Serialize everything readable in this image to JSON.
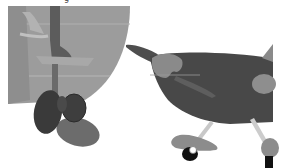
{
  "image": {
    "description": "Grayscale illustration: boat hull with rudder and propeller on the left, small airplane with landing gear on the right",
    "width": 283,
    "height": 168,
    "caption_fragment": "g",
    "colors": {
      "background": "#ffffff",
      "hull": "#9a9a9a",
      "hull_light": "#b4b4b4",
      "rudder_dark": "#5e5e5e",
      "propeller_dark": "#3c3c3c",
      "propeller_mid": "#6a6a6a",
      "plane_body": "#4a4a4a",
      "plane_patch": "#8c8c8c",
      "strut": "#c8c8c8",
      "wheel": "#111111"
    }
  },
  "objects": [
    {
      "name": "boat-hull",
      "label": "Boat hull"
    },
    {
      "name": "rudder",
      "label": "Rudder"
    },
    {
      "name": "propeller",
      "label": "Propeller"
    },
    {
      "name": "airplane",
      "label": "Airplane"
    },
    {
      "name": "landing-gear",
      "label": "Landing gear"
    }
  ]
}
